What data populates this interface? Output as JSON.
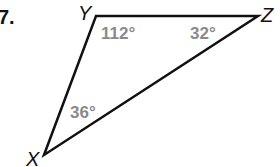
{
  "problem_number": "7.",
  "triangle": {
    "vertices": [
      {
        "name": "Y",
        "x": 96,
        "y": 16
      },
      {
        "name": "Z",
        "x": 258,
        "y": 16
      },
      {
        "name": "X",
        "x": 44,
        "y": 155
      }
    ],
    "angles": [
      {
        "vertex": "Y",
        "label": "112°"
      },
      {
        "vertex": "Z",
        "label": "32°"
      },
      {
        "vertex": "X",
        "label": "36°"
      }
    ]
  },
  "colors": {
    "line": "#111111",
    "angle_text": "#8a8a8a"
  }
}
